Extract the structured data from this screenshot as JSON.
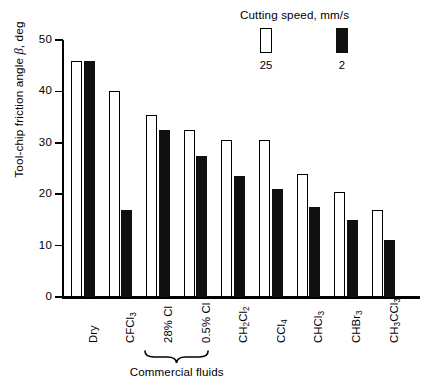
{
  "chart_data": {
    "type": "bar",
    "title": "",
    "subtitle": "",
    "xlabel": "",
    "ylabel": "Tool-chip friction angle β, deg",
    "ylim": [
      0,
      50
    ],
    "yticks": [
      0,
      10,
      20,
      30,
      40,
      50
    ],
    "ytick_labels": [
      "0",
      "10",
      "20",
      "30",
      "40",
      "50"
    ],
    "grid": false,
    "legend_position": "top-right",
    "legend_title": "Cutting speed, mm/s",
    "categories": [
      "Dry",
      "CFCl3",
      "28% Cl",
      "0.5% Cl",
      "CH2Cl2",
      "CCl4",
      "CHCl3",
      "CHBr3",
      "CH3CCl3"
    ],
    "category_labels_html": [
      "Dry",
      "CFCl<sub>3</sub>",
      "28% Cl",
      "0.5% Cl",
      "CH<sub>2</sub>Cl<sub>2</sub>",
      "CCl<sub>4</sub>",
      "CHCl<sub>3</sub>",
      "CHBr<sub>3</sub>",
      "CH<sub>3</sub>CCl<sub>3</sub>"
    ],
    "series": [
      {
        "name": "25",
        "legend_label": "25",
        "color": "#ffffff",
        "edge_color": "#000000",
        "values": [
          46,
          40,
          35.5,
          32.5,
          30.5,
          30.5,
          24,
          20.5,
          17
        ]
      },
      {
        "name": "2",
        "legend_label": "2",
        "color": "#101010",
        "edge_color": "#101010",
        "values": [
          46,
          17,
          32.5,
          27.5,
          23.5,
          21,
          17.5,
          15,
          11
        ]
      }
    ],
    "annotations": [
      {
        "text": "Commercial fluids",
        "type": "bracket-group",
        "covers": [
          "28% Cl",
          "0.5% Cl"
        ]
      }
    ]
  }
}
